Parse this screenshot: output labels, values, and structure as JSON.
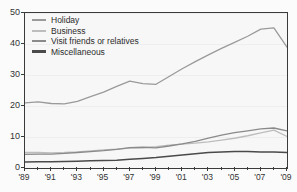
{
  "chart_data": {
    "type": "line",
    "title": "",
    "subtitle": "",
    "xlabel": "",
    "ylabel": "",
    "xlim": [
      1989,
      2009
    ],
    "ylim": [
      0,
      50
    ],
    "grid": true,
    "legend_position": "top-left",
    "x": [
      1989,
      1990,
      1991,
      1992,
      1993,
      1994,
      1995,
      1996,
      1997,
      1998,
      1999,
      2000,
      2001,
      2002,
      2003,
      2004,
      2005,
      2006,
      2007,
      2008,
      2009
    ],
    "xtick_labels": [
      "'89",
      "'91",
      "'93",
      "'95",
      "'97",
      "'99",
      "'01",
      "'03",
      "'05",
      "'07",
      "'09"
    ],
    "xtick_values": [
      1989,
      1991,
      1993,
      1995,
      1997,
      1999,
      2001,
      2003,
      2005,
      2007,
      2009
    ],
    "ytick_labels": [
      "0",
      "10",
      "20",
      "30",
      "40",
      "50"
    ],
    "ytick_values": [
      0,
      10,
      20,
      30,
      40,
      50
    ],
    "series": [
      {
        "name": "Holiday",
        "color": "#9a9a9a",
        "width": 1.3,
        "values": [
          21.0,
          21.3,
          20.8,
          20.7,
          21.5,
          23.0,
          24.5,
          26.3,
          28.0,
          27.2,
          27.0,
          29.5,
          32.0,
          34.3,
          36.5,
          38.6,
          40.5,
          42.5,
          44.8,
          45.2,
          39.0
        ]
      },
      {
        "name": "Business",
        "color": "#bdbdbd",
        "width": 1.3,
        "values": [
          5.0,
          5.0,
          4.9,
          5.0,
          5.2,
          5.5,
          5.8,
          6.1,
          6.4,
          6.6,
          6.9,
          7.4,
          7.7,
          8.0,
          8.4,
          9.0,
          9.6,
          10.4,
          11.3,
          12.2,
          10.2
        ]
      },
      {
        "name": "Visit friends or relatives",
        "color": "#8a8a8a",
        "width": 1.3,
        "values": [
          4.4,
          4.5,
          4.5,
          4.7,
          5.0,
          5.3,
          5.6,
          6.0,
          6.6,
          6.7,
          6.5,
          7.1,
          7.8,
          8.6,
          9.6,
          10.6,
          11.4,
          12.0,
          12.6,
          12.9,
          12.0
        ]
      },
      {
        "name": "Miscellaneous",
        "color": "#4a4a4a",
        "width": 1.5,
        "values": [
          1.9,
          2.0,
          2.0,
          2.1,
          2.2,
          2.3,
          2.4,
          2.5,
          2.8,
          3.1,
          3.4,
          3.8,
          4.2,
          4.6,
          5.0,
          5.2,
          5.3,
          5.3,
          5.2,
          5.2,
          5.0
        ]
      }
    ]
  }
}
